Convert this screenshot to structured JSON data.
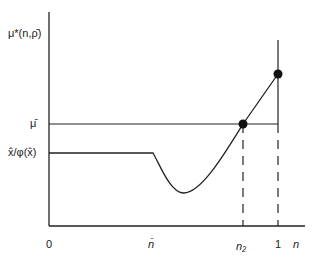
{
  "diagram": {
    "y_axis_label": "μ*(n,ρ̄)",
    "x_axis_label": "n",
    "y_ticks": [
      {
        "label": "μ̄",
        "y": 124
      },
      {
        "label": "x̂/φ(x̂)",
        "y": 153
      }
    ],
    "x_ticks": [
      {
        "label": "0",
        "x": 49
      },
      {
        "label": "n̄",
        "x": 153
      },
      {
        "label": "n₂",
        "x": 243
      },
      {
        "label": "1",
        "x": 278
      }
    ],
    "curve": {
      "description": "Flat at x̂/φ(x̂) until n̄, dips to a minimum, then rises through μ̄ at n₂ and reaches its endpoint at n = 1"
    },
    "points": [
      {
        "name": "intersection-n2",
        "x": 243,
        "y": 124
      },
      {
        "name": "endpoint-n1",
        "x": 278,
        "y": 74
      }
    ],
    "colors": {
      "line": "#222222",
      "background": "#ffffff"
    }
  }
}
